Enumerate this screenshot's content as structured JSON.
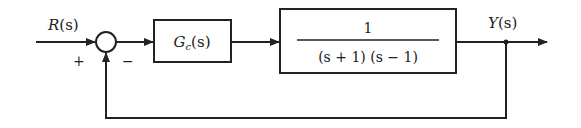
{
  "diagram": {
    "type": "feedback-control-block-diagram",
    "input_label": "R(s)",
    "input_var": "R",
    "output_label": "Y(s)",
    "output_var": "Y",
    "arg": "(s)",
    "summing_junction": {
      "plus_sign": "+",
      "minus_sign": "−"
    },
    "controller": {
      "label": "G",
      "subscript": "c",
      "arg": "(s)"
    },
    "plant": {
      "numerator": "1",
      "denominator": "(s + 1) (s − 1)"
    },
    "feedback": "unity",
    "colors": {
      "line": "#222222",
      "background": "#ffffff"
    }
  }
}
